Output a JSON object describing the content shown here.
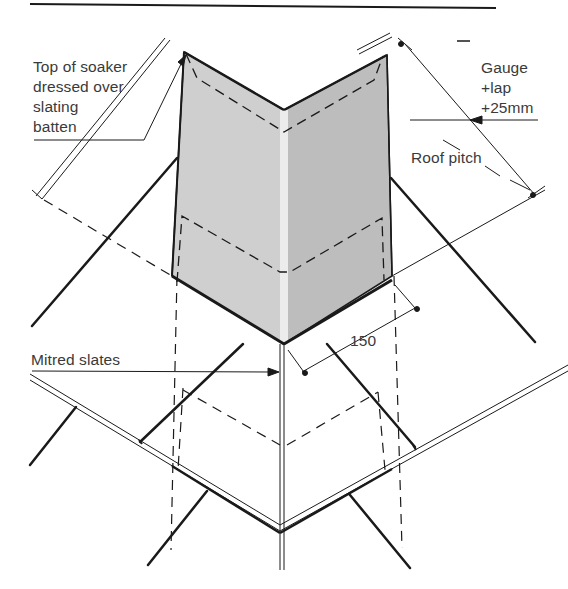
{
  "diagram": {
    "title": "",
    "colors": {
      "background": "#ffffff",
      "line": "#1a1a1a",
      "text": "#3a3a3a",
      "soaker_left_face": "#cfcfcf",
      "soaker_right_face": "#bdbdbd",
      "soaker_fold": "#ececec"
    },
    "labels": {
      "soaker_top": [
        "Top of soaker",
        "dressed over",
        "slating",
        "batten"
      ],
      "gauge": [
        "Gauge",
        "+lap",
        "+25mm"
      ],
      "roof_pitch": "Roof pitch",
      "dimension_150": "150",
      "mitred_slates": "Mitred slates"
    },
    "elements": [
      "header-rule",
      "soaker (folded metal flashing, two shaded faces)",
      "dashed outline of lower course of soaker",
      "slating batten (double line)",
      "mitred slates at corner",
      "dimension line Gauge+lap+25mm",
      "dimension line 150",
      "roof pitch indicator"
    ]
  }
}
